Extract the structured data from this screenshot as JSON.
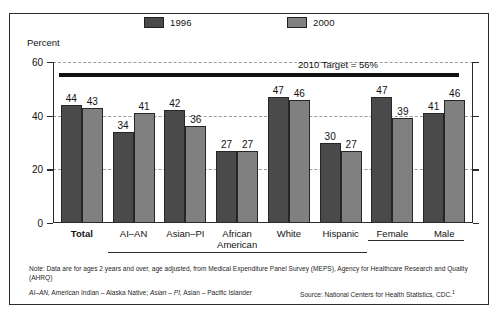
{
  "chart_data": {
    "type": "bar",
    "title": "",
    "ylabel": "Percent",
    "xlabel": "",
    "ylim": [
      0,
      60
    ],
    "yticks": [
      0,
      20,
      40,
      60
    ],
    "grid": true,
    "legend_position": "top",
    "categories": [
      "Total",
      "AI–AN",
      "Asian–PI",
      "African American",
      "White",
      "Hispanic",
      "Female",
      "Male"
    ],
    "series": [
      {
        "name": "1996",
        "color": "#4a4a4a",
        "values": [
          44,
          34,
          42,
          27,
          47,
          30,
          47,
          41
        ]
      },
      {
        "name": "2000",
        "color": "#808080",
        "values": [
          43,
          41,
          36,
          27,
          46,
          27,
          39,
          46
        ]
      }
    ],
    "annotations": [
      {
        "name": "target-line",
        "label": "2010 Target = 56%",
        "value": 56
      }
    ]
  },
  "legend": {
    "items": [
      {
        "label": "1996",
        "color": "#4a4a4a"
      },
      {
        "label": "2000",
        "color": "#808080"
      }
    ]
  },
  "axis": {
    "y_title": "Percent",
    "y_ticks": [
      "60",
      "40",
      "20",
      "0"
    ]
  },
  "x_labels": [
    {
      "line1": "Total",
      "line2": "",
      "bold": true
    },
    {
      "line1": "AI–AN",
      "line2": "",
      "bold": false
    },
    {
      "line1": "Asian–PI",
      "line2": "",
      "bold": false
    },
    {
      "line1": "African",
      "line2": "American",
      "bold": false
    },
    {
      "line1": "White",
      "line2": "",
      "bold": false
    },
    {
      "line1": "Hispanic",
      "line2": "",
      "bold": false
    },
    {
      "line1": "Female",
      "line2": "",
      "bold": false
    },
    {
      "line1": "Male",
      "line2": "",
      "bold": false
    }
  ],
  "target": {
    "label": "2010 Target = 56%"
  },
  "footnotes": {
    "note": "Note: Data are for ages 2 years and over, age adjusted, from Medical Expenditure Panel Survey (MEPS), Agency for Healthcare Research and Quality (AHRQ)",
    "abbr_1": "AI–AN,",
    "abbr_2": " American Indian – Alaska Native; ",
    "abbr_3": "Asian – PI,",
    "abbr_4": " Asian – Pacific Islander",
    "source": "Source: National Centers for Health Statistics, CDC.",
    "source_marker": "1"
  }
}
